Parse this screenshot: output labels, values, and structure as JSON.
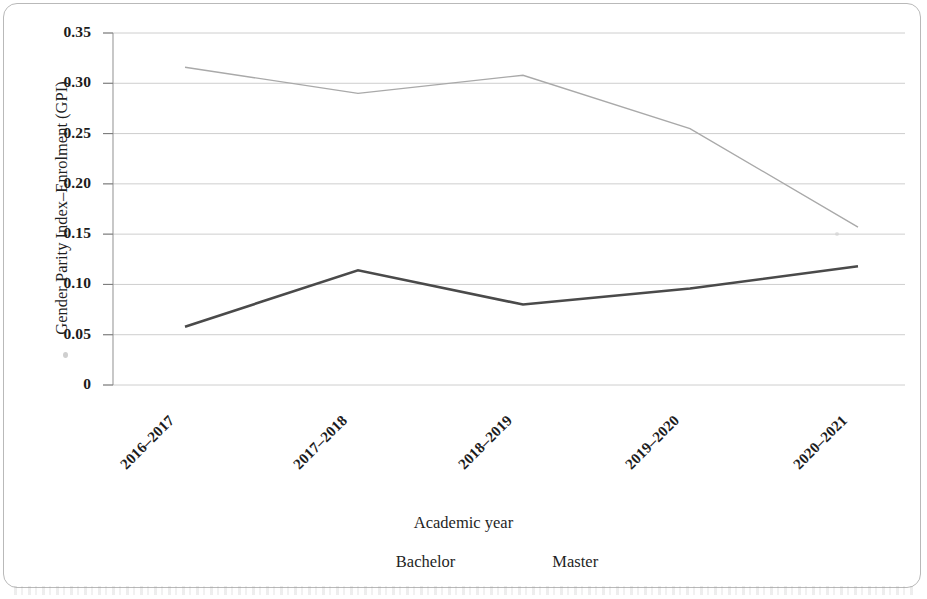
{
  "chart_data": {
    "type": "line",
    "title": "",
    "xlabel": "Academic year",
    "ylabel": "Gender Parity Index–Enrolment (GPI)",
    "categories": [
      "2016–2017",
      "2017–2018",
      "2018–2019",
      "2019–2020",
      "2020–2021"
    ],
    "series": [
      {
        "name": "Bachelor",
        "values": [
          0.316,
          0.29,
          0.308,
          0.255,
          0.157
        ],
        "color": "#a9a9a9",
        "line_width": 1.4
      },
      {
        "name": "Master",
        "values": [
          0.058,
          0.114,
          0.08,
          0.096,
          0.118
        ],
        "color": "#4a4a4a",
        "line_width": 2.6
      }
    ],
    "ylim": [
      0,
      0.35
    ],
    "yticks": [
      "0",
      "0.05",
      "0.10",
      "0.15",
      "0.20",
      "0.25",
      "0.30",
      "0.35"
    ],
    "ytick_values": [
      0,
      0.05,
      0.1,
      0.15,
      0.2,
      0.25,
      0.3,
      0.35
    ],
    "grid": true,
    "grid_color": "#c8c8c8",
    "axis_color": "#9a9a9a",
    "legend_position": "bottom",
    "background": "#ffffff"
  },
  "legend": {
    "entries": [
      {
        "label": "Bachelor"
      },
      {
        "label": "Master"
      }
    ]
  },
  "axes": {
    "x_title": "Academic year",
    "y_title": "Gender Parity Index–Enrolment (GPI)"
  }
}
